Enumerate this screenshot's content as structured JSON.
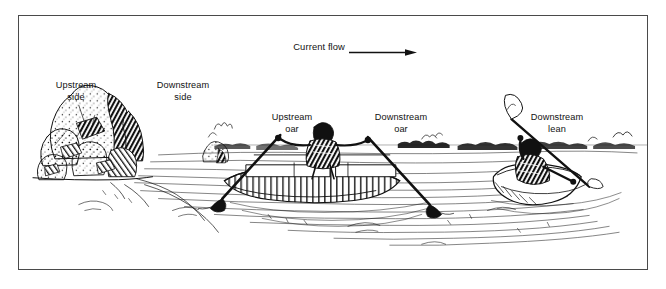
{
  "figure": {
    "type": "line-illustration",
    "background_color": "#ffffff",
    "ink_color": "#111111",
    "border_color": "#4a4a4a"
  },
  "header": {
    "current_flow_label": "Current flow",
    "arrow_icon": "arrow-right-icon",
    "arrow_direction": "right"
  },
  "labels": {
    "upstream_side": "Upstream\nside",
    "downstream_side": "Downstream\nside",
    "upstream_oar": "Upstream\noar",
    "downstream_oar": "Downstream\noar",
    "downstream_lean": "Downstream\nlean"
  },
  "scene": {
    "elements": [
      "boulder-rock-cluster",
      "small-distant-rock",
      "inflatable-raft",
      "rower-figure",
      "upstream-oar",
      "downstream-oar",
      "kayak",
      "kayaker-figure",
      "kayak-paddle",
      "shoreline-vegetation",
      "water-current-lines",
      "eddy-lines"
    ]
  }
}
